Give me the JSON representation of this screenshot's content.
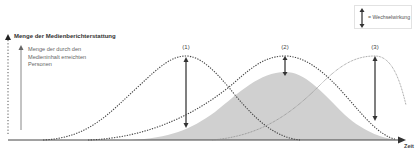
{
  "legend": {
    "icon": "double-arrow-icon",
    "label": "= Wechselwirkung"
  },
  "axes": {
    "y_title": "Menge der Medienberichterstattung",
    "y_subtitle": "Menge der durch den Medieninhalt erreichten Personen",
    "x_label": "Zeit"
  },
  "peaks": [
    {
      "label": "(1)",
      "x": 186
    },
    {
      "label": "(2)",
      "x": 285
    },
    {
      "label": "(3)",
      "x": 375
    }
  ],
  "colors": {
    "curve": "#555555",
    "fill": "#cfcfcf",
    "axis": "#444444",
    "arrow": "#555555"
  }
}
